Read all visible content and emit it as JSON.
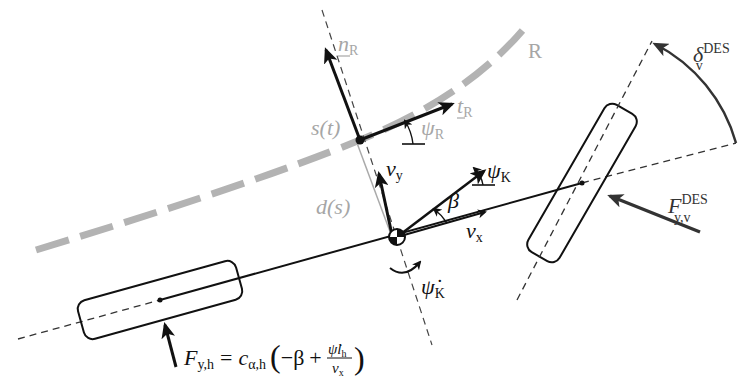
{
  "figure": {
    "type": "single-track vehicle model diagram",
    "colors": {
      "line": "#111111",
      "reference_path": "#b3b3b3",
      "reference_text": "#a6a6a6",
      "force_arrow": "#333333",
      "background": "#ffffff"
    }
  },
  "labels": {
    "reference_path": "R",
    "normal_vector": {
      "base": "n",
      "sub": "R"
    },
    "tangent_vector": {
      "base": "t",
      "sub": "R"
    },
    "path_heading": {
      "base": "ψ",
      "sub": "R"
    },
    "arc_length": "s(t)",
    "lateral_offset": "d(s)",
    "lateral_velocity": {
      "base": "v",
      "sub": "y"
    },
    "longitudinal_velocity": {
      "base": "v",
      "sub": "x"
    },
    "vehicle_heading": {
      "base": "ψ",
      "sub": "K"
    },
    "sideslip_angle": "β",
    "yaw_rate": {
      "base": "ψ̇",
      "sub": "K"
    },
    "steering_angle": {
      "base": "δ",
      "sub": "v",
      "sup": "DES"
    },
    "front_lateral_force": {
      "base": "F",
      "sub": "y,v",
      "sup": "DES"
    },
    "rear_force_equation": {
      "lhs_base": "F",
      "lhs_sub": "y,h",
      "equals": "=",
      "coef_base": "c",
      "coef_sub": "α,h",
      "open": "(",
      "minus_beta": "−β",
      "plus": "+",
      "num": "ψ̇l",
      "num_sub": "h",
      "den": "v",
      "den_sub": "x",
      "close": ")"
    }
  }
}
